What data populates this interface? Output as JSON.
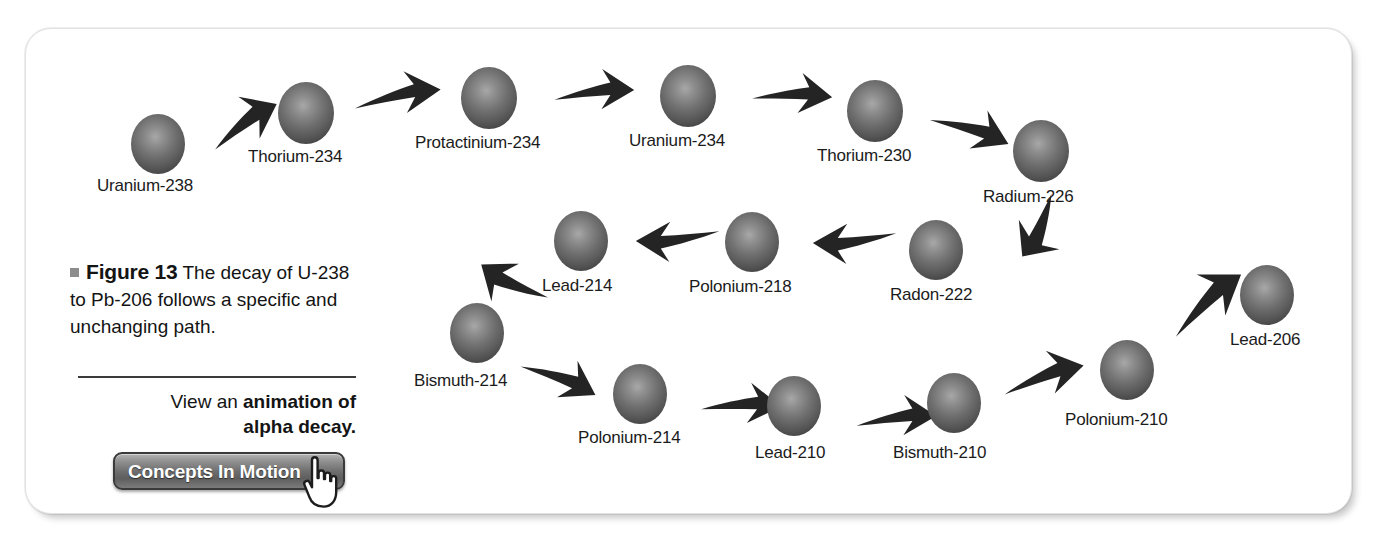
{
  "figure": {
    "bullet": "",
    "label": "Figure 13",
    "caption": " The decay of U-238 to Pb-206 follows a specific and unchanging path."
  },
  "promo": {
    "line1_plain": "View an ",
    "line1_bold": "animation of",
    "line2_bold": "alpha decay.",
    "button_label": "Concepts In Motion",
    "cursor_icon": "pointing-hand-cursor-icon"
  },
  "chart_data": {
    "type": "diagram",
    "nodes": [
      {
        "id": "u238",
        "label": "Uranium-238",
        "row": 1,
        "order": 1,
        "cx": 158,
        "cy": 141,
        "r": 27,
        "label_x": 97,
        "label_y": 176
      },
      {
        "id": "th234",
        "label": "Thorium-234",
        "row": 1,
        "order": 2,
        "cx": 306,
        "cy": 110,
        "r": 28,
        "label_x": 248,
        "label_y": 147
      },
      {
        "id": "pa234",
        "label": "Protactinium-234",
        "row": 1,
        "order": 3,
        "cx": 489,
        "cy": 95,
        "r": 28,
        "label_x": 415,
        "label_y": 133
      },
      {
        "id": "u234",
        "label": "Uranium-234",
        "row": 1,
        "order": 4,
        "cx": 688,
        "cy": 93,
        "r": 28,
        "label_x": 629,
        "label_y": 131
      },
      {
        "id": "th230",
        "label": "Thorium-230",
        "row": 1,
        "order": 5,
        "cx": 875,
        "cy": 108,
        "r": 28,
        "label_x": 817,
        "label_y": 146
      },
      {
        "id": "ra226",
        "label": "Radium-226",
        "row": 1,
        "order": 6,
        "cx": 1041,
        "cy": 148,
        "r": 28,
        "label_x": 983,
        "label_y": 187
      },
      {
        "id": "rn222",
        "label": "Radon-222",
        "row": 2,
        "order": 7,
        "cx": 936,
        "cy": 247,
        "r": 27,
        "label_x": 890,
        "label_y": 285
      },
      {
        "id": "po218",
        "label": "Polonium-218",
        "row": 2,
        "order": 8,
        "cx": 752,
        "cy": 239,
        "r": 27,
        "label_x": 689,
        "label_y": 277
      },
      {
        "id": "pb214",
        "label": "Lead-214",
        "row": 2,
        "order": 9,
        "cx": 581,
        "cy": 238,
        "r": 27,
        "label_x": 542,
        "label_y": 276
      },
      {
        "id": "bi214",
        "label": "Bismuth-214",
        "row": 3,
        "order": 10,
        "cx": 477,
        "cy": 330,
        "r": 27,
        "label_x": 414,
        "label_y": 371
      },
      {
        "id": "po214",
        "label": "Polonium-214",
        "row": 3,
        "order": 11,
        "cx": 640,
        "cy": 391,
        "r": 27,
        "label_x": 578,
        "label_y": 428
      },
      {
        "id": "pb210",
        "label": "Lead-210",
        "row": 3,
        "order": 12,
        "cx": 794,
        "cy": 403,
        "r": 27,
        "label_x": 755,
        "label_y": 443
      },
      {
        "id": "bi210",
        "label": "Bismuth-210",
        "row": 3,
        "order": 13,
        "cx": 954,
        "cy": 400,
        "r": 27,
        "label_x": 893,
        "label_y": 443
      },
      {
        "id": "po210",
        "label": "Polonium-210",
        "row": 3,
        "order": 14,
        "cx": 1127,
        "cy": 367,
        "r": 27,
        "label_x": 1065,
        "label_y": 410
      },
      {
        "id": "pb206",
        "label": "Lead-206",
        "row": 3,
        "order": 15,
        "cx": 1267,
        "cy": 292,
        "r": 27,
        "label_x": 1230,
        "label_y": 330
      }
    ],
    "edges": [
      {
        "from": "u238",
        "to": "th234",
        "direction": "right-up",
        "x": 205,
        "y": 95,
        "w": 78,
        "h": 58,
        "rot": -28
      },
      {
        "from": "th234",
        "to": "pa234",
        "direction": "right",
        "x": 352,
        "y": 70,
        "w": 90,
        "h": 52,
        "rot": -6
      },
      {
        "from": "pa234",
        "to": "u234",
        "direction": "right",
        "x": 553,
        "y": 67,
        "w": 82,
        "h": 50,
        "rot": 0
      },
      {
        "from": "u234",
        "to": "th230",
        "direction": "right",
        "x": 751,
        "y": 70,
        "w": 82,
        "h": 50,
        "rot": 6
      },
      {
        "from": "th230",
        "to": "ra226",
        "direction": "right-down",
        "x": 928,
        "y": 103,
        "w": 84,
        "h": 52,
        "rot": 24
      },
      {
        "from": "ra226",
        "to": "rn222",
        "direction": "down-left",
        "x": 1005,
        "y": 196,
        "w": 70,
        "h": 62,
        "rot": 125
      },
      {
        "from": "rn222",
        "to": "po218",
        "direction": "left",
        "x": 812,
        "y": 216,
        "w": 86,
        "h": 50,
        "rot": 180
      },
      {
        "from": "po218",
        "to": "pb214",
        "direction": "left",
        "x": 635,
        "y": 214,
        "w": 86,
        "h": 50,
        "rot": 180
      },
      {
        "from": "pb214",
        "to": "bi214",
        "direction": "down-left",
        "x": 475,
        "y": 255,
        "w": 76,
        "h": 58,
        "rot": 215
      },
      {
        "from": "bi214",
        "to": "po214",
        "direction": "right-down",
        "x": 518,
        "y": 352,
        "w": 82,
        "h": 52,
        "rot": 28
      },
      {
        "from": "po214",
        "to": "pb210",
        "direction": "right",
        "x": 700,
        "y": 380,
        "w": 82,
        "h": 50,
        "rot": 5
      },
      {
        "from": "pb210",
        "to": "bi210",
        "direction": "right",
        "x": 855,
        "y": 393,
        "w": 82,
        "h": 50,
        "rot": 0
      },
      {
        "from": "bi210",
        "to": "po210",
        "direction": "right-up",
        "x": 1000,
        "y": 350,
        "w": 86,
        "h": 54,
        "rot": -13
      },
      {
        "from": "po210",
        "to": "pb206",
        "direction": "right-up",
        "x": 1160,
        "y": 272,
        "w": 92,
        "h": 62,
        "rot": -36
      }
    ]
  },
  "colors": {
    "sphere_dark": "#3b3b3b",
    "sphere_light": "#a8a8a8",
    "arrow": "#242424",
    "text": "#141414",
    "card_bg": "#ffffff",
    "button_border": "#3a3a3a"
  }
}
